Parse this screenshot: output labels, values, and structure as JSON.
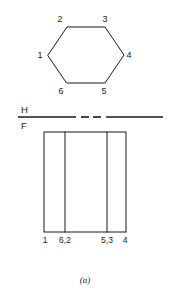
{
  "figure": {
    "caption": "(a)",
    "width": 171,
    "height": 302,
    "background_color": "#ffffff",
    "line_color": "#1a1a1a"
  },
  "fold_line": {
    "upper_plane_label": "H",
    "lower_plane_label": "F",
    "y": 117,
    "x_start": 18,
    "x_end": 163,
    "segments": [
      {
        "x1": 18,
        "x2": 76
      },
      {
        "x1": 81,
        "x2": 89
      },
      {
        "x1": 93,
        "x2": 101
      },
      {
        "x1": 106,
        "x2": 163
      }
    ]
  },
  "top_view": {
    "name": "hexagon-top-view",
    "shape": "hexagon",
    "points": "48,55 67,27 105,27 124,55 105,83 67,83",
    "vertices": [
      {
        "id": "1",
        "label": "1",
        "x": 48,
        "y": 55,
        "label_x": 40,
        "label_y": 58
      },
      {
        "id": "2",
        "label": "2",
        "x": 67,
        "y": 27,
        "label_x": 60,
        "label_y": 22
      },
      {
        "id": "3",
        "label": "3",
        "x": 105,
        "y": 27,
        "label_x": 105,
        "label_y": 22
      },
      {
        "id": "4",
        "label": "4",
        "x": 124,
        "y": 55,
        "label_x": 129,
        "label_y": 58
      },
      {
        "id": "5",
        "label": "5",
        "x": 105,
        "y": 83,
        "label_x": 104,
        "label_y": 94
      },
      {
        "id": "6",
        "label": "6",
        "x": 67,
        "y": 83,
        "label_x": 61,
        "label_y": 94
      }
    ]
  },
  "front_view": {
    "name": "rectangle-front-view",
    "left": 44,
    "right": 126,
    "top": 132,
    "bottom": 232,
    "internal_lines": [
      {
        "x": 65
      },
      {
        "x": 107
      }
    ],
    "edge_labels": [
      {
        "label": "1",
        "x": 45,
        "y": 243
      },
      {
        "label": "6,2",
        "x": 65,
        "y": 243
      },
      {
        "label": "5,3",
        "x": 107,
        "y": 243
      },
      {
        "label": "4",
        "x": 125,
        "y": 243
      }
    ]
  }
}
